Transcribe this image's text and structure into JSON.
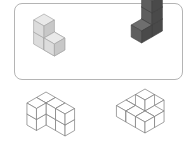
{
  "diagram": {
    "type": "isometric-cube-puzzle",
    "reference_panel": {
      "border_color": "#b4b4b4",
      "figures": [
        {
          "name": "light-cube-figure",
          "fill_top": "#e9e9e9",
          "fill_left": "#dcdcdc",
          "fill_right": "#c8c8c8",
          "stroke": "#a8a8a8",
          "cube_count": 4
        },
        {
          "name": "dark-cube-figure",
          "fill_top": "#6e6e6e",
          "fill_left": "#5e5e5e",
          "fill_right": "#4a4a4a",
          "stroke": "#444444",
          "cube_count": 4
        }
      ]
    },
    "options": [
      {
        "name": "wireframe-option-left",
        "stroke": "#7a7a7a",
        "cube_count": 8
      },
      {
        "name": "wireframe-option-right",
        "stroke": "#7a7a7a",
        "cube_count": 8
      }
    ]
  }
}
